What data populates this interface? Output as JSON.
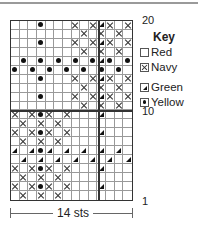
{
  "chart": {
    "columns": 14,
    "rows": 20,
    "row_labels": [
      {
        "row": 20,
        "text": "20"
      },
      {
        "row": 10,
        "text": "10"
      },
      {
        "row": 1,
        "text": "1"
      }
    ],
    "width_label": "14 sts",
    "grid_rows_top_to_bottom": [
      "...o...x.xgx.x",
      "........x.x.x.",
      "...o...x.xgx.x",
      "........x.x.x.",
      ".o.o.o.o.ogo.o",
      "o.o.o.o.o.o.o.",
      "...o...x.xgx.x",
      "........x.x.x.",
      "...o...x.xgx.x",
      "........x.x.x.",
      "x.xox.x...g...",
      ".x.x.x........",
      "x.xox.x...g...",
      ".x.x.x........",
      "g.gog.g.g.g.g.",
      ".g.g.g.g.g.g.g",
      "x.xox.x...g...",
      ".x.x.x........",
      "x.xox.x...g...",
      ".x.x.x........"
    ],
    "symbol_legend": {
      ".": "red",
      "x": "navy",
      "g": "green",
      "o": "yellow"
    }
  },
  "key": {
    "title": "Key",
    "items": [
      {
        "symbol": "empty-square",
        "label": "Red"
      },
      {
        "symbol": "cross",
        "label": "Navy"
      },
      {
        "symbol": "triangle",
        "label": "Green"
      },
      {
        "symbol": "dot",
        "label": "Yellow"
      }
    ]
  }
}
